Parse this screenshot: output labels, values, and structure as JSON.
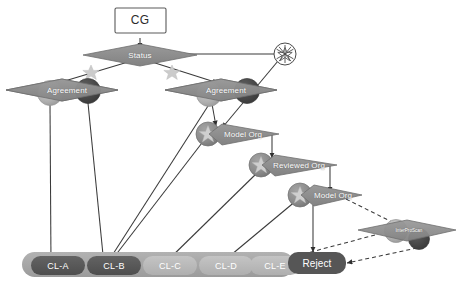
{
  "diagram": {
    "title_node": {
      "label": "CG"
    },
    "root": {
      "label": "Status"
    },
    "agreements": [
      {
        "label": "Agreement"
      },
      {
        "label": "Agreement"
      }
    ],
    "org_nodes": [
      {
        "label": "Model Org"
      },
      {
        "label": "Reviewed Org"
      },
      {
        "label": "Model Org"
      }
    ],
    "scan_node": {
      "label": "InterProScan"
    },
    "reject_node": {
      "label": "Reject"
    },
    "leaves": [
      {
        "label": "CL-A",
        "tone": "dark"
      },
      {
        "label": "CL-B",
        "tone": "dark"
      },
      {
        "label": "CL-C",
        "tone": "light"
      },
      {
        "label": "CL-D",
        "tone": "light"
      },
      {
        "label": "CL-E",
        "tone": "light"
      }
    ],
    "icons": {
      "starburst": "starburst-circle-icon",
      "star_left": "star-icon",
      "star_right": "star-icon",
      "circle_star": "circle-star-icon",
      "circle_light": "circle-light-icon",
      "circle_dark": "circle-dark-icon"
    },
    "colors": {
      "diamond_fill": "#8d8d8d",
      "diamond_stroke": "#6f6f6f",
      "leaf_dark": "#585858",
      "leaf_light": "#b9b9b9",
      "tray": "#a6a6a6",
      "circle_light": "#b0b0b0",
      "circle_dark": "#4a4a4a",
      "circle_mid": "#8a8a8a",
      "star_light": "#cfcfcf",
      "edge": "#3a3a3a",
      "box_stroke": "#555555",
      "box_fill": "#ffffff",
      "reject_fill": "#585858",
      "text_light": "#ffffff",
      "text_dark": "#2b2b2b"
    }
  }
}
